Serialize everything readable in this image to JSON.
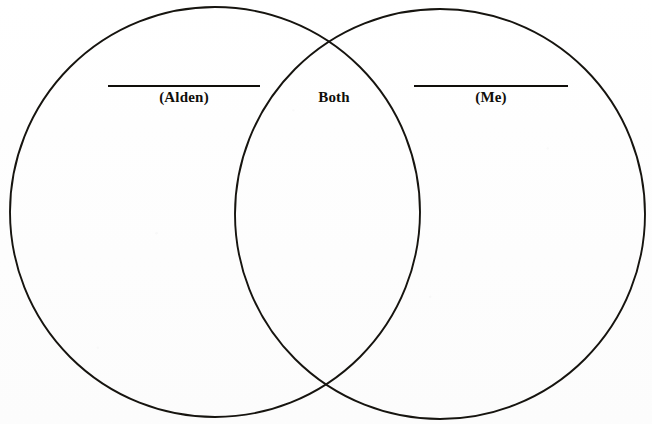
{
  "document": {
    "type": "venn-diagram-worksheet",
    "background_color": "#ffffff",
    "ink_color": "#100e0a"
  },
  "diagram": {
    "kind": "two-circle-venn",
    "stroke_color": "#16140f",
    "stroke_width": 1.9,
    "circles": [
      {
        "id": "left",
        "label_key": "left",
        "center_x": 215,
        "center_y": 212,
        "radius": 205
      },
      {
        "id": "right",
        "label_key": "right",
        "center_x": 440,
        "center_y": 214,
        "radius": 205
      }
    ],
    "intersection": {
      "top_x": 330,
      "top_y": 52,
      "bottom_x": 330,
      "bottom_y": 370
    }
  },
  "labels": {
    "left": {
      "text": "(Alden)",
      "has_blank_rule": true
    },
    "center": {
      "text": "Both",
      "has_blank_rule": false
    },
    "right": {
      "text": "(Me)",
      "has_blank_rule": true
    }
  },
  "blank_rules": {
    "left": {
      "x": 108,
      "y": 85,
      "width": 152
    },
    "right": {
      "x": 414,
      "y": 85,
      "width": 154
    }
  }
}
